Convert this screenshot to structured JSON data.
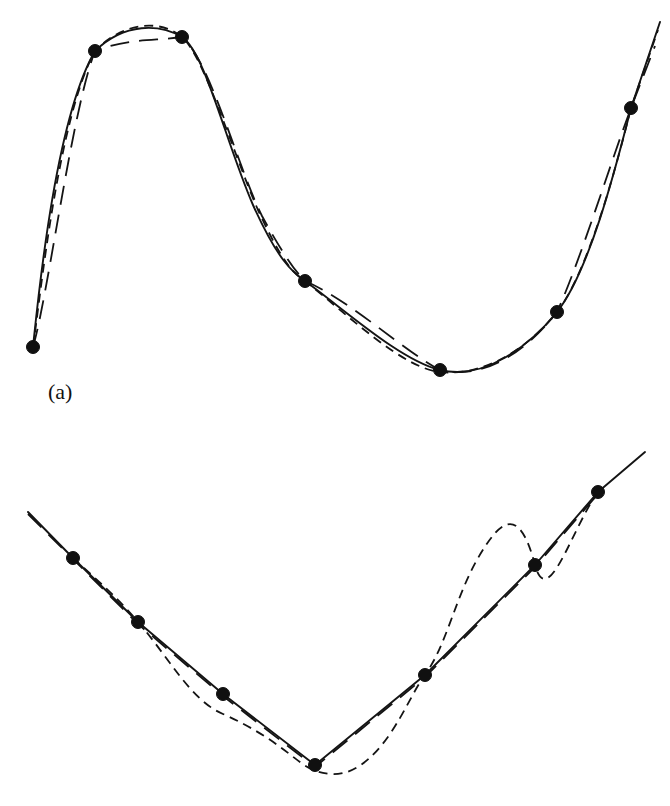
{
  "figure": {
    "background_color": "#ffffff",
    "ink_color": "#141414",
    "panels": [
      {
        "id": "a",
        "label": "(a)",
        "label_position": {
          "x": 48,
          "y": 381
        },
        "description": "Oscillating data set: three interpolants through eight knots",
        "knot_marker": {
          "shape": "filled-circle",
          "radius": 6.5,
          "color": "#101010"
        }
      },
      {
        "id": "b",
        "label": "(b)",
        "label_position": {
          "x": 48,
          "y": 753
        },
        "description": "V-shaped data set: three interpolants through seven knots",
        "knot_marker": {
          "shape": "filled-circle",
          "radius": 6.5,
          "color": "#101010"
        }
      }
    ],
    "legend_styles": [
      {
        "name": "solid",
        "dash": "none",
        "width": 1.9
      },
      {
        "name": "short-dashed",
        "dash": "9 6",
        "width": 1.8
      },
      {
        "name": "long-dashed",
        "dash": "19 10",
        "width": 1.8
      }
    ]
  },
  "chart_data": {
    "type": "line",
    "title": "",
    "xlabel": "",
    "ylabel": "",
    "grid": false,
    "legend_position": "none",
    "axis_visible": false,
    "panels": [
      {
        "id": "a",
        "label": "(a)",
        "viewbox": [
          0,
          0,
          670,
          430
        ],
        "knots": {
          "x": [
            33,
            95,
            182,
            305,
            440,
            557,
            631
          ],
          "y": [
            347,
            51,
            37,
            281,
            370,
            312,
            108
          ]
        },
        "series": [
          {
            "name": "solid",
            "style": "solid",
            "path": "M 33 347 C 38 300 55 120 95 51 C 125 22 160 24 182 37 C 205 52 225 140 253 205 C 278 260 292 272 305 281 C 345 310 400 360 440 370 C 485 381 530 345 557 312 C 592 268 620 150 631 108 L 660 22"
          },
          {
            "name": "short-dashed",
            "style": "short-dashed",
            "path": "M 33 347 C 40 300 58 118 95 51 C 125 20 162 20 182 37 C 204 56 232 150 258 210 C 282 262 293 273 305 281 C 348 315 402 368 440 372 C 488 377 532 344 557 312 C 590 270 620 152 631 108 L 658 30"
          },
          {
            "name": "long-dashed",
            "style": "long-dashed",
            "path": "M 33 347 C 48 296 72 110 95 51 C 128 38 156 41 182 37 C 210 60 238 168 262 216 C 285 258 296 272 305 281 C 350 300 405 352 440 370 C 490 382 534 342 557 312 C 580 262 612 158 631 108 L 655 46"
          }
        ]
      },
      {
        "id": "b",
        "label": "(b)",
        "viewbox": [
          0,
          430,
          670,
          376
        ],
        "knots": {
          "x": [
            73,
            138,
            223,
            315,
            425,
            535,
            598
          ],
          "y": [
            558,
            622,
            694,
            765,
            675,
            565,
            492
          ]
        },
        "series": [
          {
            "name": "solid",
            "style": "solid",
            "path": "M 28 512 L 73 558 L 138 622 L 223 694 L 315 765 L 425 675 L 535 565 L 598 492 L 645 452"
          },
          {
            "name": "long-dashed",
            "style": "long-dashed",
            "path": "M 28 514 L 73 559 L 138 624 L 223 696 L 315 767 L 425 677 L 535 567 L 598 494"
          },
          {
            "name": "short-dashed",
            "style": "short-dashed",
            "path": "M 73 558 C 95 578 120 600 138 622 C 168 656 190 700 223 714 C 250 726 272 740 292 756 C 305 766 312 772 330 774 C 352 776 372 760 390 734 C 406 710 414 690 425 675 C 447 644 455 598 478 558 C 498 524 518 500 535 565 C 548 612 572 528 598 492"
          }
        ]
      }
    ]
  }
}
